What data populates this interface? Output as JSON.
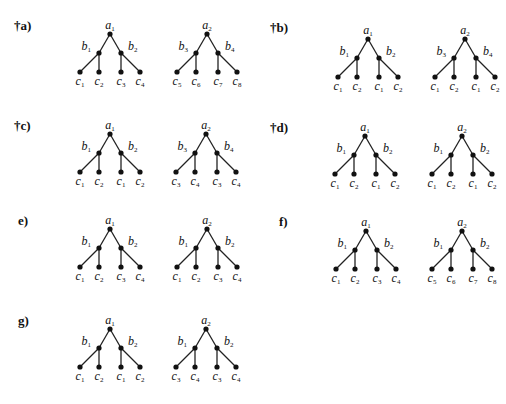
{
  "figure": {
    "panels": [
      {
        "id": "a",
        "label": "†a)",
        "x": 14,
        "y": 19,
        "trees": [
          {
            "root": "a1",
            "left": "b1",
            "right": "b2",
            "leaves": [
              "c1",
              "c2",
              "c3",
              "c4"
            ],
            "rx": 110,
            "ry": 34
          },
          {
            "root": "a2",
            "left": "b3",
            "right": "b4",
            "leaves": [
              "c5",
              "c6",
              "c7",
              "c8"
            ],
            "rx": 207,
            "ry": 34
          }
        ]
      },
      {
        "id": "b",
        "label": "†b)",
        "x": 270,
        "y": 21,
        "trees": [
          {
            "root": "a1",
            "left": "b1",
            "right": "b2",
            "leaves": [
              "c1",
              "c2",
              "c1",
              "c2"
            ],
            "rx": 368,
            "ry": 39
          },
          {
            "root": "a2",
            "left": "b3",
            "right": "b4",
            "leaves": [
              "c1",
              "c2",
              "c1",
              "c2"
            ],
            "rx": 465,
            "ry": 39
          }
        ]
      },
      {
        "id": "c",
        "label": "†c)",
        "x": 14,
        "y": 119,
        "trees": [
          {
            "root": "a1",
            "left": "b1",
            "right": "b2",
            "leaves": [
              "c1",
              "c2",
              "c1",
              "c2"
            ],
            "rx": 110,
            "ry": 134
          },
          {
            "root": "a2",
            "left": "b3",
            "right": "b4",
            "leaves": [
              "c3",
              "c4",
              "c3",
              "c4"
            ],
            "rx": 206,
            "ry": 134
          }
        ]
      },
      {
        "id": "d",
        "label": "†d)",
        "x": 270,
        "y": 121,
        "trees": [
          {
            "root": "a1",
            "left": "b1",
            "right": "b2",
            "leaves": [
              "c1",
              "c2",
              "c1",
              "c2"
            ],
            "rx": 365,
            "ry": 136
          },
          {
            "root": "a2",
            "left": "b1",
            "right": "b2",
            "leaves": [
              "c1",
              "c2",
              "c1",
              "c2"
            ],
            "rx": 462,
            "ry": 136
          }
        ]
      },
      {
        "id": "e",
        "label": "e)",
        "x": 18,
        "y": 214,
        "trees": [
          {
            "root": "a1",
            "left": "b1",
            "right": "b2",
            "leaves": [
              "c1",
              "c2",
              "c3",
              "c4"
            ],
            "rx": 110,
            "ry": 229
          },
          {
            "root": "a2",
            "left": "b1",
            "right": "b2",
            "leaves": [
              "c1",
              "c2",
              "c3",
              "c4"
            ],
            "rx": 207,
            "ry": 229
          }
        ]
      },
      {
        "id": "f",
        "label": "f)",
        "x": 279,
        "y": 215,
        "trees": [
          {
            "root": "a1",
            "left": "b1",
            "right": "b2",
            "leaves": [
              "c1",
              "c2",
              "c3",
              "c4"
            ],
            "rx": 366,
            "ry": 231
          },
          {
            "root": "a2",
            "left": "b1",
            "right": "b2",
            "leaves": [
              "c5",
              "c6",
              "c7",
              "c8"
            ],
            "rx": 462,
            "ry": 231
          }
        ]
      },
      {
        "id": "g",
        "label": "g)",
        "x": 18,
        "y": 314,
        "trees": [
          {
            "root": "a1",
            "left": "b1",
            "right": "b2",
            "leaves": [
              "c1",
              "c2",
              "c1",
              "c2"
            ],
            "rx": 110,
            "ry": 329
          },
          {
            "root": "a2",
            "left": "b1",
            "right": "b2",
            "leaves": [
              "c3",
              "c4",
              "c3",
              "c4"
            ],
            "rx": 206,
            "ry": 329
          }
        ]
      }
    ]
  }
}
